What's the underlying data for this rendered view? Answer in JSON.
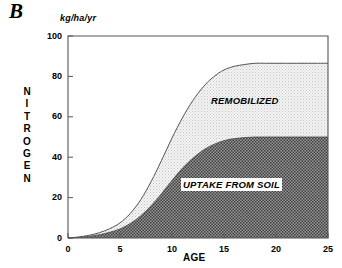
{
  "panel": {
    "letter": "B"
  },
  "axes": {
    "units": "kg/ha/yr",
    "ylabel": "NITROGEN",
    "ylabel_letters": [
      "N",
      "I",
      "T",
      "R",
      "O",
      "G",
      "E",
      "N"
    ],
    "xlabel": "AGE",
    "yticks": [
      "0",
      "20",
      "40",
      "60",
      "80",
      "100"
    ],
    "xticks": [
      "0",
      "5",
      "10",
      "15",
      "20",
      "25"
    ]
  },
  "series_labels": {
    "remobilized": "REMOBILIZED",
    "uptake": "UPTAKE FROM SOIL"
  },
  "colors": {
    "axis": "#555555",
    "text": "#000000",
    "uptake_fill": "#7a7a7a",
    "remobilized_fill": "#ececec",
    "curve_line": "#555555"
  },
  "chart_data": {
    "type": "area",
    "title": "",
    "subtitle": "",
    "xlabel": "AGE",
    "ylabel": "NITROGEN",
    "units": "kg/ha/yr",
    "xlim": [
      0,
      25
    ],
    "ylim": [
      0,
      100
    ],
    "xticks": [
      0,
      5,
      10,
      15,
      20,
      25
    ],
    "yticks": [
      0,
      20,
      40,
      60,
      80,
      100
    ],
    "grid": false,
    "legend": "inline-annotations",
    "stacked": true,
    "x": [
      0,
      1,
      2,
      3,
      4,
      5,
      6,
      7,
      8,
      9,
      10,
      11,
      12,
      13,
      14,
      15,
      16,
      17,
      18,
      19,
      20,
      21,
      22,
      23,
      24,
      25
    ],
    "series": [
      {
        "name": "UPTAKE FROM SOIL",
        "fill": "#7a7a7a",
        "values": [
          0,
          0.3,
          0.8,
          1.6,
          2.8,
          4.5,
          7.2,
          11.0,
          16.0,
          22.0,
          28.5,
          34.5,
          39.5,
          43.5,
          46.3,
          48.2,
          49.2,
          49.7,
          50.0,
          50.0,
          50.0,
          50.0,
          50.0,
          50.0,
          50.0,
          50.0
        ]
      },
      {
        "name": "REMOBILIZED",
        "fill": "#ececec",
        "values": [
          0,
          0.2,
          0.5,
          1.0,
          1.8,
          3.0,
          5.0,
          8.0,
          12.0,
          16.5,
          21.0,
          25.0,
          28.5,
          31.3,
          33.5,
          35.0,
          35.8,
          36.2,
          36.5,
          36.5,
          36.5,
          36.5,
          36.5,
          36.5,
          36.5,
          36.5
        ]
      }
    ],
    "totals": [
      0,
      0.5,
      1.3,
      2.6,
      4.6,
      7.5,
      12.2,
      19.0,
      28.0,
      38.5,
      49.5,
      59.5,
      68.0,
      74.8,
      79.8,
      83.2,
      85.0,
      85.9,
      86.5,
      86.5,
      86.5,
      86.5,
      86.5,
      86.5,
      86.5,
      86.5
    ],
    "plateau_total": 86.5,
    "plateau_uptake": 50
  }
}
